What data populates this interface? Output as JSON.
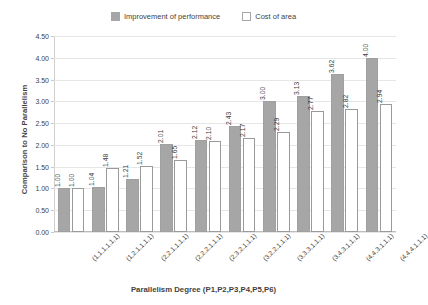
{
  "chart_data": {
    "type": "bar",
    "title": "",
    "xlabel": "Parallelism  Degree  (P1,P2,P3,P4,P5,P6)",
    "ylabel": "Comparison to No Parallelism",
    "ylim": [
      0,
      4.5
    ],
    "ytick_labels": [
      "0.00",
      "0.50",
      "1.00",
      "1.50",
      "2.00",
      "2.50",
      "3.00",
      "3.50",
      "4.00",
      "4.50"
    ],
    "ytick_values": [
      0,
      0.5,
      1.0,
      1.5,
      2.0,
      2.5,
      3.0,
      3.5,
      4.0,
      4.5
    ],
    "grid": true,
    "legend_position": "top-center",
    "categories": [
      "(1,1,1,1,1,1)",
      "(1,2,1,1,1,1)",
      "(2,2,1,1,1,1)",
      "(2,2,2,1,1,1)",
      "(2,3,2,1,1,1)",
      "(3,2,2,1,1,1)",
      "(3,3,3,1,1,1)",
      "(3,4,3,1,1,1)",
      "(4,4,3,1,1,1)",
      "(4,4,4,1,1,1)"
    ],
    "series": [
      {
        "name": "Improvement of performance",
        "color": "#a6a6a6",
        "values": [
          1.0,
          1.04,
          1.21,
          2.01,
          2.12,
          2.43,
          3.0,
          3.13,
          3.62,
          4.0
        ],
        "labels": [
          "1.00",
          "1.04",
          "1.21",
          "2.01",
          "2.12",
          "2.43",
          "3.00",
          "3.13",
          "3.62",
          "4.00"
        ]
      },
      {
        "name": "Cost of area",
        "color": "#ffffff",
        "values": [
          1.0,
          1.48,
          1.52,
          1.65,
          2.1,
          2.17,
          2.29,
          2.77,
          2.82,
          2.94
        ],
        "labels": [
          "1.00",
          "1.48",
          "1.52",
          "1.65",
          "2.10",
          "2.17",
          "2.29",
          "2.77",
          "2.82",
          "2.94"
        ]
      }
    ]
  },
  "legend": {
    "entries": [
      {
        "label": "Improvement of performance"
      },
      {
        "label": "Cost of area"
      }
    ]
  }
}
